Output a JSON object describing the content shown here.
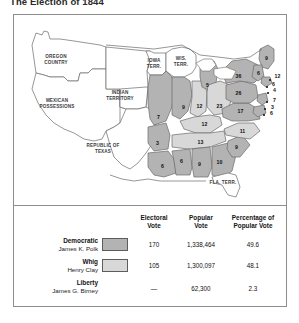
{
  "title": "The Election of 1844",
  "colors": {
    "democratic_fill": "#b3b3b3",
    "whig_fill": "#d8d8d8",
    "territory_fill": "#ffffff",
    "outline": "#6a6a6a",
    "frame": "#8d8d8d"
  },
  "map": {
    "territory_labels": [
      {
        "name": "oregon-country",
        "text": "OREGON\nCOUNTRY",
        "x": 40,
        "y": 42
      },
      {
        "name": "mexican-possessions",
        "text": "MEXICAN\nPOSSESSIONS",
        "x": 28,
        "y": 86
      },
      {
        "name": "republic-of-texas",
        "text": "REPUBLIC OF\nTEXAS",
        "x": 88,
        "y": 134
      },
      {
        "name": "indian-territory",
        "text": "INDIAN\nTERRITORY",
        "x": 104,
        "y": 78
      },
      {
        "name": "iowa-territory",
        "text": "IOWA\nTERR.",
        "x": 140,
        "y": 47
      },
      {
        "name": "wisconsin-territory",
        "text": "WIS.\nTERR.",
        "x": 166,
        "y": 45
      },
      {
        "name": "florida-territory",
        "text": "FLA. TERR.",
        "x": 208,
        "y": 168
      }
    ],
    "electoral_votes": [
      {
        "state": "missouri",
        "value": "7",
        "x": 144,
        "y": 103,
        "party": "democratic"
      },
      {
        "state": "arkansas",
        "value": "3",
        "x": 143,
        "y": 129,
        "party": "democratic"
      },
      {
        "state": "louisiana",
        "value": "6",
        "x": 148,
        "y": 152,
        "party": "democratic"
      },
      {
        "state": "illinois",
        "value": "9",
        "x": 169,
        "y": 93,
        "party": "democratic"
      },
      {
        "state": "indiana",
        "value": "12",
        "x": 185,
        "y": 92,
        "party": "whig"
      },
      {
        "state": "michigan",
        "value": "5",
        "x": 193,
        "y": 71,
        "party": "democratic"
      },
      {
        "state": "ohio",
        "value": "23",
        "x": 205,
        "y": 92,
        "party": "whig"
      },
      {
        "state": "kentucky",
        "value": "12",
        "x": 190,
        "y": 110,
        "party": "whig"
      },
      {
        "state": "tennessee",
        "value": "13",
        "x": 186,
        "y": 128,
        "party": "whig"
      },
      {
        "state": "mississippi",
        "value": "6",
        "x": 167,
        "y": 147,
        "party": "democratic"
      },
      {
        "state": "alabama",
        "value": "9",
        "x": 185,
        "y": 150,
        "party": "democratic"
      },
      {
        "state": "georgia",
        "value": "10",
        "x": 205,
        "y": 148,
        "party": "democratic"
      },
      {
        "state": "south-carolina",
        "value": "9",
        "x": 222,
        "y": 133,
        "party": "democratic"
      },
      {
        "state": "north-carolina",
        "value": "11",
        "x": 228,
        "y": 117,
        "party": "whig"
      },
      {
        "state": "virginia",
        "value": "17",
        "x": 226,
        "y": 97,
        "party": "democratic"
      },
      {
        "state": "pennsylvania",
        "value": "26",
        "x": 224,
        "y": 79,
        "party": "democratic"
      },
      {
        "state": "new-york",
        "value": "36",
        "x": 224,
        "y": 62,
        "party": "democratic"
      },
      {
        "state": "maine",
        "value": "9",
        "x": 251,
        "y": 44,
        "party": "democratic"
      },
      {
        "state": "new-hampshire",
        "value": "6",
        "x": 244,
        "y": 59,
        "party": "democratic"
      }
    ],
    "coastal_votes": [
      {
        "state": "massachusetts",
        "value": "12",
        "x": 262,
        "y": 62,
        "dotx": 255,
        "doty": 65
      },
      {
        "state": "connecticut",
        "value": "6",
        "x": 258,
        "y": 70,
        "dotx": 252,
        "doty": 72
      },
      {
        "state": "rhode-island",
        "value": "4",
        "x": 259,
        "y": 76,
        "dotx": 253,
        "doty": 78
      },
      {
        "state": "new-jersey",
        "value": "7",
        "x": 259,
        "y": 86,
        "dotx": 252,
        "doty": 87
      },
      {
        "state": "delaware",
        "value": "3",
        "x": 257,
        "y": 93,
        "dotx": 250,
        "doty": 94
      },
      {
        "state": "maryland",
        "value": "6",
        "x": 256,
        "y": 99,
        "dotx": 249,
        "doty": 100
      }
    ]
  },
  "legend": {
    "headers": [
      {
        "name": "electoral-vote",
        "text": "Electoral\nVote"
      },
      {
        "name": "popular-vote",
        "text": "Popular\nVote"
      },
      {
        "name": "percentage-popular-vote",
        "text": "Percentage of\nPopular Vote"
      }
    ],
    "rows": [
      {
        "party": "Democratic",
        "candidate": "James K. Polk",
        "swatch": "#b3b3b3",
        "has_swatch": true,
        "electoral_vote": "170",
        "popular_vote": "1,338,464",
        "percentage": "49.6"
      },
      {
        "party": "Whig",
        "candidate": "Henry Clay",
        "swatch": "#d8d8d8",
        "has_swatch": true,
        "electoral_vote": "105",
        "popular_vote": "1,300,097",
        "percentage": "48.1"
      },
      {
        "party": "Liberty",
        "candidate": "James G. Birney",
        "swatch": "",
        "has_swatch": false,
        "electoral_vote": "—",
        "popular_vote": "62,300",
        "percentage": "2.3"
      }
    ]
  }
}
